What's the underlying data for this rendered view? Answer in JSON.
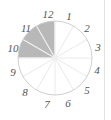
{
  "figure": {
    "width": 111,
    "height": 120,
    "background": "#ffffff",
    "divider_color": "#e2e2e2"
  },
  "clock": {
    "center_x": 55,
    "center_y": 58,
    "radius": 37,
    "sector_count": 12,
    "outline_color": "#cfcfcf",
    "spoke_color": "#e6e6e6",
    "shaded_fill": "#b8b8b8",
    "shaded_sectors": [
      10,
      11,
      12
    ],
    "shaded_from_hour": 9,
    "shaded_to_hour": 12,
    "numerals": [
      {
        "value": "12",
        "hour": 12,
        "x": 48,
        "y": 14
      },
      {
        "value": "1",
        "hour": 1,
        "x": 69,
        "y": 16
      },
      {
        "value": "2",
        "hour": 2,
        "x": 87,
        "y": 28
      },
      {
        "value": "3",
        "hour": 3,
        "x": 98,
        "y": 47
      },
      {
        "value": "4",
        "hour": 4,
        "x": 97,
        "y": 70
      },
      {
        "value": "5",
        "hour": 5,
        "x": 87,
        "y": 90
      },
      {
        "value": "6",
        "hour": 6,
        "x": 68,
        "y": 103
      },
      {
        "value": "7",
        "hour": 7,
        "x": 47,
        "y": 104
      },
      {
        "value": "8",
        "hour": 8,
        "x": 25,
        "y": 92
      },
      {
        "value": "9",
        "hour": 9,
        "x": 13,
        "y": 72
      },
      {
        "value": "10",
        "hour": 10,
        "x": 13,
        "y": 48
      },
      {
        "value": "11",
        "hour": 11,
        "x": 26,
        "y": 28
      }
    ]
  }
}
